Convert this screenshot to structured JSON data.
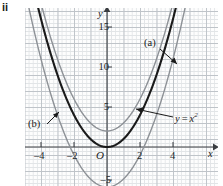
{
  "part_label": "ii",
  "axes": {
    "x_axis_name": "x",
    "y_axis_name": "y",
    "origin_label": "O",
    "x_ticks": [
      {
        "value": -4,
        "label": "–4"
      },
      {
        "value": -2,
        "label": "–2"
      },
      {
        "value": 2,
        "label": "2"
      },
      {
        "value": 4,
        "label": "4"
      }
    ],
    "y_ticks": [
      {
        "value": 15,
        "label": "15"
      },
      {
        "value": 10,
        "label": "10"
      },
      {
        "value": 5,
        "label": "5"
      },
      {
        "value": -5,
        "label": "–5"
      }
    ]
  },
  "annotations": {
    "label_a": "(a)",
    "label_b": "(b)",
    "label_equation_y": "y",
    "label_equation_eq": "=",
    "label_equation_x": "x",
    "label_equation_pow": "2"
  },
  "colors": {
    "base_curve": "#1a1a1a",
    "curve_a": "#8d9196",
    "curve_b": "#8d9196",
    "grid_minor": "#d9dde0",
    "grid_major": "#b9bfc4",
    "axis": "#3a3d41",
    "text": "#1b1b1b",
    "background": "#fdfdfd"
  },
  "chart_data": {
    "type": "line",
    "title": "",
    "xlabel": "x",
    "ylabel": "y",
    "xlim": [
      -5.2,
      5.6
    ],
    "ylim": [
      -5.6,
      17.2
    ],
    "grid": true,
    "legend": "inline-annotations",
    "xticks": [
      -4,
      -2,
      2,
      4
    ],
    "yticks": [
      15,
      10,
      5,
      -5
    ],
    "series": [
      {
        "name": "y = x^2",
        "style": "solid-bold-dark",
        "color": "#1a1a1a",
        "equation": "y = x^2",
        "vertex": [
          0,
          0
        ],
        "x": [
          -4.2,
          -3.5,
          -3,
          -2.5,
          -2,
          -1.5,
          -1,
          -0.5,
          0,
          0.5,
          1,
          1.5,
          2,
          2.5,
          3,
          3.5,
          4.2
        ],
        "values": [
          17.64,
          12.25,
          9,
          6.25,
          4,
          2.25,
          1,
          0.25,
          0,
          0.25,
          1,
          2.25,
          4,
          6.25,
          9,
          12.25,
          17.64
        ]
      },
      {
        "name": "(a)",
        "style": "solid-thin-gray",
        "color": "#8d9196",
        "equation": "y = x^2 + 2",
        "vertex": [
          0,
          2
        ],
        "x": [
          -3.9,
          -3.5,
          -3,
          -2.5,
          -2,
          -1.5,
          -1,
          -0.5,
          0,
          0.5,
          1,
          1.5,
          2,
          2.5,
          3,
          3.5,
          3.9
        ],
        "values": [
          17.21,
          14.25,
          11,
          8.25,
          6,
          4.25,
          3,
          2.25,
          2,
          2.25,
          3,
          4.25,
          6,
          8.25,
          11,
          14.25,
          17.21
        ]
      },
      {
        "name": "(b)",
        "style": "solid-thin-gray",
        "color": "#8d9196",
        "equation": "y = x^2 - 5",
        "vertex": [
          0,
          -5
        ],
        "x_intercepts": [
          -2.236,
          2.236
        ],
        "x": [
          -4.75,
          -4.5,
          -4,
          -3.5,
          -3,
          -2.5,
          -2,
          -1.5,
          -1,
          -0.5,
          0,
          0.5,
          1,
          1.5,
          2,
          2.5,
          3,
          3.5,
          4,
          4.5,
          4.75
        ],
        "values": [
          17.56,
          15.25,
          11,
          7.25,
          4,
          1.25,
          -1,
          -2.75,
          -4,
          -4.75,
          -5,
          -4.75,
          -4,
          -2.75,
          -1,
          1.25,
          4,
          7.25,
          11,
          15.25,
          17.56
        ]
      }
    ],
    "annotations": [
      {
        "text": "(a)",
        "points_to": "y = x^2 curve",
        "at": [
          2.3,
          13.5
        ]
      },
      {
        "text": "(b)",
        "points_to": "y = x^2 - 5 curve",
        "at": [
          -4.4,
          3.2
        ]
      },
      {
        "text": "y = x^2",
        "points_to": "y = x^2 curve",
        "at": [
          3.6,
          3.3
        ]
      }
    ]
  }
}
